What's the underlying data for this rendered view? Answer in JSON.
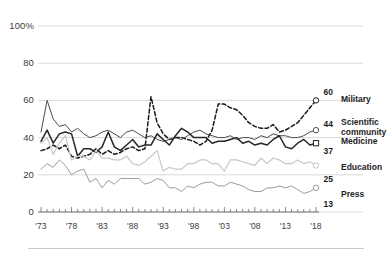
{
  "axes": {
    "y_ticks": [
      "100%",
      "80",
      "60",
      "40",
      "20",
      "0"
    ],
    "y_values": [
      100,
      80,
      60,
      40,
      20,
      0
    ],
    "x_ticks": [
      "'73",
      "'78",
      "'83",
      "'88",
      "'93",
      "'98",
      "'03",
      "'08",
      "'13",
      "'18"
    ],
    "x_values": [
      1973,
      1978,
      1983,
      1988,
      1993,
      1998,
      2003,
      2008,
      2013,
      2018
    ]
  },
  "series_labels": {
    "military": "Military",
    "scientific": "Scientific\ncommunity",
    "medicine": "Medicine",
    "education": "Education",
    "press": "Press"
  },
  "end_values": {
    "military": "60",
    "scientific": "44",
    "medicine": "37",
    "education": "25",
    "press": "13"
  },
  "colors": {
    "military": "#1a1a1a",
    "scientific": "#4d4d4d",
    "medicine": "#262626",
    "education": "#c7c7c7",
    "press": "#9b9b9b",
    "grid": "#cfcfcf",
    "axis": "#6b6b6b",
    "text": "#2b2b2b"
  },
  "chart_data": {
    "type": "line",
    "title": "",
    "subtitle": "",
    "xlabel": "",
    "ylabel": "",
    "xlim": [
      1973,
      2018
    ],
    "ylim": [
      0,
      100
    ],
    "grid": true,
    "legend": "right-of-plot-endpoint-labels",
    "x": [
      1973,
      1974,
      1975,
      1976,
      1977,
      1978,
      1979,
      1980,
      1981,
      1982,
      1983,
      1984,
      1985,
      1986,
      1987,
      1988,
      1989,
      1990,
      1991,
      1992,
      1993,
      1994,
      1995,
      1996,
      1997,
      1998,
      1999,
      2000,
      2001,
      2002,
      2003,
      2004,
      2005,
      2006,
      2007,
      2008,
      2009,
      2010,
      2011,
      2012,
      2013,
      2014,
      2015,
      2016,
      2017,
      2018
    ],
    "series": [
      {
        "name": "Military",
        "style": "dashed",
        "end_label": "60",
        "marker": "circle-open",
        "values": [
          33,
          34,
          36,
          34,
          36,
          30,
          29,
          30,
          31,
          34,
          31,
          33,
          31,
          32,
          34,
          35,
          33,
          34,
          62,
          48,
          42,
          39,
          40,
          40,
          39,
          38,
          36,
          38,
          44,
          58,
          58,
          56,
          55,
          52,
          48,
          46,
          45,
          45,
          47,
          43,
          44,
          46,
          48,
          52,
          56,
          60
        ]
      },
      {
        "name": "Scientific community",
        "style": "solid",
        "end_label": "44",
        "marker": "circle-open",
        "values": [
          43,
          60,
          50,
          46,
          47,
          43,
          45,
          42,
          40,
          41,
          43,
          44,
          42,
          40,
          43,
          44,
          42,
          40,
          41,
          39,
          38,
          39,
          40,
          39,
          41,
          43,
          44,
          42,
          41,
          40,
          40,
          41,
          39,
          40,
          40,
          39,
          41,
          40,
          42,
          41,
          41,
          40,
          40,
          41,
          43,
          44
        ]
      },
      {
        "name": "Medicine",
        "style": "solid",
        "end_label": "37",
        "marker": "square-open",
        "values": [
          38,
          44,
          37,
          42,
          43,
          42,
          30,
          34,
          34,
          32,
          35,
          43,
          35,
          33,
          36,
          39,
          35,
          36,
          36,
          42,
          39,
          36,
          41,
          45,
          43,
          40,
          40,
          40,
          37,
          38,
          38,
          39,
          40,
          37,
          38,
          36,
          37,
          36,
          39,
          41,
          35,
          34,
          37,
          39,
          36,
          37
        ]
      },
      {
        "name": "Education",
        "style": "solid-light",
        "end_label": "25",
        "marker": "circle-open",
        "values": [
          37,
          40,
          31,
          37,
          41,
          28,
          30,
          30,
          28,
          33,
          29,
          29,
          28,
          28,
          30,
          26,
          25,
          27,
          30,
          33,
          22,
          24,
          23,
          23,
          26,
          26,
          28,
          28,
          26,
          26,
          22,
          28,
          28,
          27,
          26,
          25,
          29,
          26,
          29,
          28,
          26,
          26,
          28,
          26,
          27,
          25
        ]
      },
      {
        "name": "Press",
        "style": "solid-mid",
        "end_label": "13",
        "marker": "circle-open",
        "values": [
          23,
          26,
          24,
          28,
          25,
          20,
          22,
          23,
          16,
          18,
          13,
          17,
          15,
          18,
          18,
          18,
          18,
          15,
          16,
          18,
          17,
          13,
          13,
          11,
          14,
          13,
          15,
          16,
          16,
          14,
          14,
          16,
          15,
          14,
          12,
          11,
          11,
          13,
          13,
          14,
          13,
          14,
          12,
          10,
          11,
          13
        ]
      }
    ]
  }
}
